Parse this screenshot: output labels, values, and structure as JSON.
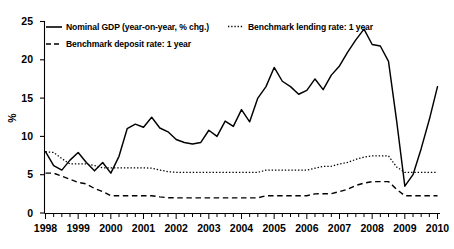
{
  "chart_data": {
    "type": "line",
    "title": "",
    "xlabel": "",
    "ylabel": "%",
    "ylim": [
      0,
      25
    ],
    "yticks": [
      0,
      5,
      10,
      15,
      20,
      25
    ],
    "xlim": [
      1998,
      2010
    ],
    "xticks": [
      1998,
      1999,
      2000,
      2001,
      2002,
      2003,
      2004,
      2005,
      2006,
      2007,
      2008,
      2009,
      2010
    ],
    "minor_tick_interval_years": 0.25,
    "grid": false,
    "legend_position": "top-inside",
    "x": [
      1998,
      1998.25,
      1998.5,
      1998.75,
      1999,
      1999.25,
      1999.5,
      1999.75,
      2000,
      2000.25,
      2000.5,
      2000.75,
      2001,
      2001.25,
      2001.5,
      2001.75,
      2002,
      2002.25,
      2002.5,
      2002.75,
      2003,
      2003.25,
      2003.5,
      2003.75,
      2004,
      2004.25,
      2004.5,
      2004.75,
      2005,
      2005.25,
      2005.5,
      2005.75,
      2006,
      2006.25,
      2006.5,
      2006.75,
      2007,
      2007.25,
      2007.5,
      2007.75,
      2008,
      2008.25,
      2008.5,
      2008.75,
      2009,
      2009.25,
      2009.5,
      2009.75,
      2010
    ],
    "series": [
      {
        "name": "Nominal GDP (year-on-year, % chg.)",
        "style": "solid",
        "values": [
          8.0,
          6.2,
          5.6,
          6.9,
          7.9,
          6.6,
          5.5,
          6.6,
          5.2,
          7.4,
          11.0,
          11.6,
          11.2,
          12.5,
          11.1,
          10.6,
          9.6,
          9.2,
          9.0,
          9.2,
          10.8,
          10.0,
          12.0,
          11.3,
          13.5,
          11.9,
          15.0,
          16.5,
          19.0,
          17.2,
          16.5,
          15.5,
          16.0,
          17.5,
          16.1,
          18.0,
          19.2,
          21.0,
          22.6,
          24.0,
          22.0,
          21.8,
          19.8,
          12.0,
          3.5,
          5.0,
          8.4,
          12.2,
          16.5
        ]
      },
      {
        "name": "Benchmark lending rate: 1 year",
        "style": "dotted",
        "values": [
          8.0,
          7.9,
          7.1,
          6.4,
          6.4,
          6.4,
          6.2,
          5.9,
          5.9,
          5.9,
          5.9,
          5.9,
          5.9,
          5.85,
          5.6,
          5.4,
          5.3,
          5.3,
          5.3,
          5.3,
          5.3,
          5.3,
          5.3,
          5.3,
          5.3,
          5.3,
          5.3,
          5.6,
          5.6,
          5.6,
          5.6,
          5.6,
          5.6,
          5.85,
          6.1,
          6.1,
          6.4,
          6.6,
          7.0,
          7.3,
          7.45,
          7.45,
          7.45,
          6.0,
          5.3,
          5.3,
          5.3,
          5.3,
          5.3
        ]
      },
      {
        "name": "Benchmark deposit rate: 1 year",
        "style": "dashed",
        "values": [
          5.2,
          5.2,
          4.8,
          4.4,
          4.0,
          3.8,
          3.2,
          2.8,
          2.25,
          2.25,
          2.25,
          2.25,
          2.25,
          2.25,
          2.1,
          2.0,
          1.98,
          1.98,
          1.98,
          1.98,
          1.98,
          1.98,
          1.98,
          1.98,
          1.98,
          1.98,
          1.98,
          2.25,
          2.25,
          2.25,
          2.25,
          2.25,
          2.25,
          2.5,
          2.52,
          2.52,
          2.8,
          3.1,
          3.6,
          3.9,
          4.1,
          4.1,
          4.1,
          3.1,
          2.25,
          2.25,
          2.25,
          2.25,
          2.25
        ]
      }
    ]
  },
  "axis": {
    "y_title": "%",
    "y_tick_labels": [
      "25",
      "20",
      "15",
      "10",
      "5",
      "0"
    ],
    "x_tick_labels": [
      "1998",
      "1999",
      "2000",
      "2001",
      "2002",
      "2003",
      "2004",
      "2005",
      "2006",
      "2007",
      "2008",
      "2009",
      "2010"
    ]
  },
  "legend": {
    "items": [
      {
        "label": "Nominal GDP (year-on-year, % chg.)",
        "style": "solid"
      },
      {
        "label": "Benchmark lending rate: 1 year",
        "style": "dotted"
      },
      {
        "label": "Benchmark deposit rate: 1 year",
        "style": "dashed"
      }
    ]
  },
  "colors": {
    "line": "#000000",
    "axis": "#000000",
    "background": "#ffffff"
  }
}
